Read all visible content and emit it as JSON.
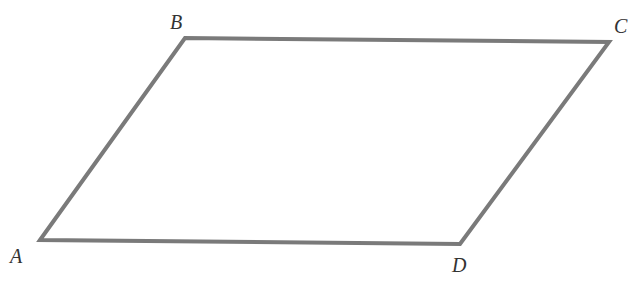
{
  "diagram": {
    "type": "parallelogram",
    "stroke_color": "#7a7a7a",
    "stroke_width": 4,
    "vertices": [
      {
        "name": "A",
        "x": 40,
        "y": 240,
        "label_x": 10,
        "label_y": 246
      },
      {
        "name": "B",
        "x": 185,
        "y": 38,
        "label_x": 170,
        "label_y": 12
      },
      {
        "name": "C",
        "x": 609,
        "y": 42,
        "label_x": 614,
        "label_y": 16
      },
      {
        "name": "D",
        "x": 460,
        "y": 244,
        "label_x": 452,
        "label_y": 255
      }
    ]
  }
}
